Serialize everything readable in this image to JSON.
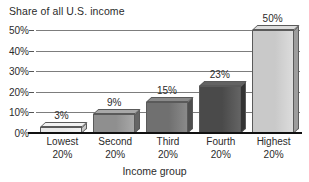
{
  "chart_data": {
    "type": "bar",
    "title": "Share of all U.S. income",
    "xlabel": "Income group",
    "ylabel": "",
    "categories": [
      "Lowest 20%",
      "Second 20%",
      "Third 20%",
      "Fourth 20%",
      "Highest 20%"
    ],
    "category_lines": [
      [
        "Lowest",
        "20%"
      ],
      [
        "Second",
        "20%"
      ],
      [
        "Third",
        "20%"
      ],
      [
        "Fourth",
        "20%"
      ],
      [
        "Highest",
        "20%"
      ]
    ],
    "values": [
      3,
      9,
      15,
      23,
      50
    ],
    "value_labels": [
      "3%",
      "9%",
      "15%",
      "23%",
      "50%"
    ],
    "ylim": [
      0,
      50
    ],
    "yticks": [
      0,
      10,
      20,
      30,
      40,
      50
    ],
    "ytick_labels": [
      "0%",
      "10%",
      "20%",
      "30%",
      "40%",
      "50%"
    ],
    "grid": true,
    "legend": "none",
    "bar_colors": [
      "#e9e9e9",
      "#8f8f8f",
      "#707070",
      "#4a4a4a",
      "#c9c9c9"
    ],
    "bar_side_colors": [
      "#c8c8c8",
      "#656565",
      "#4e4e4e",
      "#333333",
      "#9d9d9d"
    ],
    "bar_top_colors": [
      "#f2f2f2",
      "#a8a8a8",
      "#8a8a8a",
      "#636363",
      "#dcdcdc"
    ],
    "axis_color": "#111111",
    "grid_color": "#7d7d7d"
  }
}
